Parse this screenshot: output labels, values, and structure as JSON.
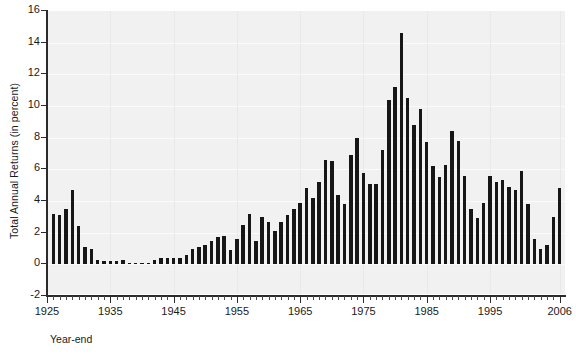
{
  "chart_data": {
    "type": "bar",
    "title": "",
    "xlabel": "Year-end",
    "ylabel": "Total Annual Returns (in percent)",
    "ylim": [
      -2,
      16
    ],
    "xlim": [
      1925,
      2007
    ],
    "grid": true,
    "legend": null,
    "y_ticks": [
      -2,
      0,
      2,
      4,
      6,
      8,
      10,
      12,
      14,
      16
    ],
    "y_tick_labels": [
      "-2",
      "0",
      "2",
      "4",
      "6",
      "8",
      "10",
      "12",
      "14",
      "16"
    ],
    "x_tick_labels": [
      "1925",
      "1935",
      "1945",
      "1955",
      "1965",
      "1975",
      "1985",
      "1995",
      "2006"
    ],
    "x_tick_values": [
      1925,
      1935,
      1945,
      1955,
      1965,
      1975,
      1985,
      1995,
      2006
    ],
    "bar_color": "#161616",
    "plot_background": "#f1f1f1",
    "categories": [
      1926,
      1927,
      1928,
      1929,
      1930,
      1931,
      1932,
      1933,
      1934,
      1935,
      1936,
      1937,
      1938,
      1939,
      1940,
      1941,
      1942,
      1943,
      1944,
      1945,
      1946,
      1947,
      1948,
      1949,
      1950,
      1951,
      1952,
      1953,
      1954,
      1955,
      1956,
      1957,
      1958,
      1959,
      1960,
      1961,
      1962,
      1963,
      1964,
      1965,
      1966,
      1967,
      1968,
      1969,
      1970,
      1971,
      1972,
      1973,
      1974,
      1975,
      1976,
      1977,
      1978,
      1979,
      1980,
      1981,
      1982,
      1983,
      1984,
      1985,
      1986,
      1987,
      1988,
      1989,
      1990,
      1991,
      1992,
      1993,
      1994,
      1995,
      1996,
      1997,
      1998,
      1999,
      2000,
      2001,
      2002,
      2003,
      2004,
      2005,
      2006
    ],
    "values": [
      3.2,
      3.1,
      3.5,
      4.7,
      2.4,
      1.1,
      1.0,
      0.3,
      0.2,
      0.2,
      0.2,
      0.3,
      0.0,
      0.0,
      0.0,
      0.1,
      0.3,
      0.4,
      0.4,
      0.4,
      0.4,
      0.6,
      1.0,
      1.1,
      1.2,
      1.5,
      1.7,
      1.8,
      0.9,
      1.6,
      2.5,
      3.2,
      1.5,
      3.0,
      2.7,
      2.1,
      2.7,
      3.1,
      3.5,
      3.9,
      4.8,
      4.2,
      5.2,
      6.6,
      6.5,
      4.4,
      3.8,
      6.9,
      8.0,
      5.8,
      5.1,
      5.1,
      7.2,
      10.4,
      11.2,
      14.6,
      10.5,
      8.8,
      9.8,
      7.7,
      6.2,
      5.5,
      6.3,
      8.4,
      7.8,
      5.6,
      3.5,
      2.9,
      3.9,
      5.6,
      5.2,
      5.3,
      4.9,
      4.7,
      5.9,
      3.8,
      1.6,
      1.0,
      1.2,
      3.0,
      4.8
    ]
  }
}
